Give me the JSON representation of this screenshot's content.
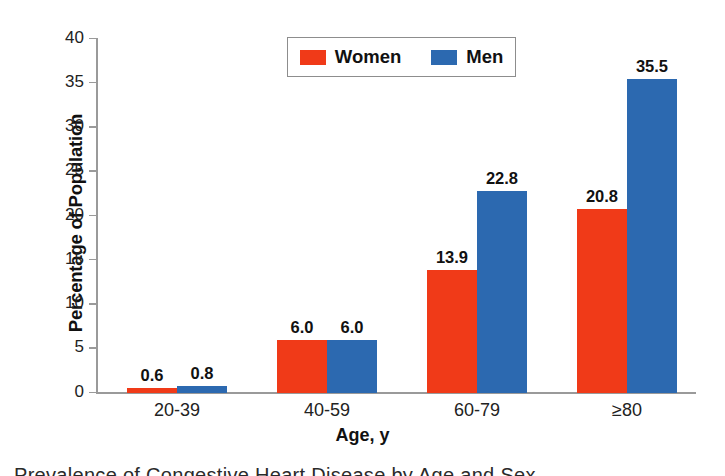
{
  "figure": {
    "background_color": "#ffffff"
  },
  "legend": {
    "position": "top-center",
    "items": [
      {
        "label": "Women",
        "color": "#f03a18",
        "swatch_name": "legend-swatch-women"
      },
      {
        "label": "Men",
        "color": "#2c69b0",
        "swatch_name": "legend-swatch-men"
      }
    ]
  },
  "axes": {
    "y_title": "Percentage of Population",
    "x_title": "Age, y",
    "y_ticks": [
      "0",
      "5",
      "10",
      "15",
      "20",
      "25",
      "30",
      "35",
      "40"
    ],
    "x_ticks": [
      "20-39",
      "40-59",
      "60-79",
      "≥80"
    ]
  },
  "caption": {
    "partial_text": "Prevalence of Congestive Heart Disease by Age and Sex"
  },
  "chart_data": {
    "type": "bar",
    "title": "",
    "xlabel": "Age, y",
    "ylabel": "Percentage of Population",
    "categories": [
      "20-39",
      "40-59",
      "60-79",
      "≥80"
    ],
    "series": [
      {
        "name": "Women",
        "color": "#f03a18",
        "values": [
          0.6,
          6.0,
          13.9,
          20.8
        ]
      },
      {
        "name": "Men",
        "color": "#2c69b0",
        "values": [
          0.8,
          6.0,
          22.8,
          35.5
        ]
      }
    ],
    "value_labels": {
      "Women": [
        "0.6",
        "6.0",
        "13.9",
        "20.8"
      ],
      "Men": [
        "0.8",
        "6.0",
        "22.8",
        "35.5"
      ]
    },
    "ylim": [
      0,
      40
    ],
    "ytick_step": 5,
    "grid": false,
    "legend_position": "top-center"
  }
}
